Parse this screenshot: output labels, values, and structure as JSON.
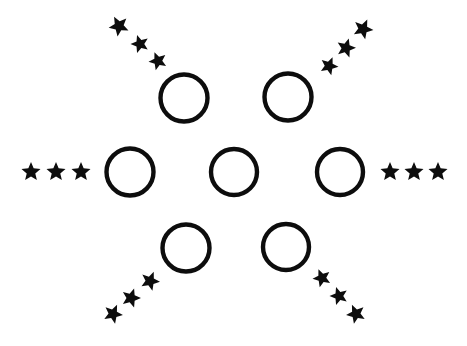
{
  "figure": {
    "width": 467,
    "height": 346,
    "background_color": "#ffffff",
    "ink_color": "#0d0d0d",
    "circle_stroke_width": 4.4,
    "circle_count": 7,
    "star_count": 18,
    "star_group_count": 6,
    "circles": [
      {
        "name": "circle-top-left",
        "cx": 184,
        "cy": 98,
        "r": 23.5
      },
      {
        "name": "circle-top-right",
        "cx": 288,
        "cy": 97,
        "r": 23.5
      },
      {
        "name": "circle-mid-left",
        "cx": 130,
        "cy": 172,
        "r": 23.5
      },
      {
        "name": "circle-center",
        "cx": 234,
        "cy": 172,
        "r": 23.0
      },
      {
        "name": "circle-mid-right",
        "cx": 340,
        "cy": 172,
        "r": 23.0
      },
      {
        "name": "circle-bottom-left",
        "cx": 186,
        "cy": 248,
        "r": 23.5
      },
      {
        "name": "circle-bottom-right",
        "cx": 286,
        "cy": 247,
        "r": 23.0
      }
    ],
    "star_groups": [
      {
        "name": "star-trail-upper-left",
        "direction": "upper-left",
        "stars": [
          {
            "cx": 119,
            "cy": 26,
            "size": 21,
            "rotation": -28
          },
          {
            "cx": 140,
            "cy": 44,
            "size": 19,
            "rotation": -18
          },
          {
            "cx": 158,
            "cy": 61,
            "size": 19,
            "rotation": -22
          }
        ]
      },
      {
        "name": "star-trail-upper-right",
        "direction": "upper-right",
        "stars": [
          {
            "cx": 329,
            "cy": 66,
            "size": 19,
            "rotation": 22
          },
          {
            "cx": 346,
            "cy": 48,
            "size": 20,
            "rotation": 16
          },
          {
            "cx": 363,
            "cy": 29,
            "size": 21,
            "rotation": 24
          }
        ]
      },
      {
        "name": "star-trail-left",
        "direction": "left",
        "stars": [
          {
            "cx": 31,
            "cy": 172,
            "size": 20,
            "rotation": 0
          },
          {
            "cx": 56,
            "cy": 172,
            "size": 20,
            "rotation": 0
          },
          {
            "cx": 81,
            "cy": 172,
            "size": 20,
            "rotation": 0
          }
        ]
      },
      {
        "name": "star-trail-right",
        "direction": "right",
        "stars": [
          {
            "cx": 390,
            "cy": 172,
            "size": 20,
            "rotation": 0
          },
          {
            "cx": 414,
            "cy": 172,
            "size": 20,
            "rotation": 0
          },
          {
            "cx": 438,
            "cy": 172,
            "size": 20,
            "rotation": 0
          }
        ]
      },
      {
        "name": "star-trail-lower-left",
        "direction": "lower-left",
        "stars": [
          {
            "cx": 113,
            "cy": 314,
            "size": 20,
            "rotation": 24
          },
          {
            "cx": 131,
            "cy": 298,
            "size": 20,
            "rotation": 18
          },
          {
            "cx": 150,
            "cy": 281,
            "size": 20,
            "rotation": 22
          }
        ]
      },
      {
        "name": "star-trail-lower-right",
        "direction": "lower-right",
        "stars": [
          {
            "cx": 322,
            "cy": 278,
            "size": 19,
            "rotation": -22
          },
          {
            "cx": 339,
            "cy": 296,
            "size": 19,
            "rotation": -18
          },
          {
            "cx": 356,
            "cy": 314,
            "size": 20,
            "rotation": -24
          }
        ]
      }
    ]
  }
}
